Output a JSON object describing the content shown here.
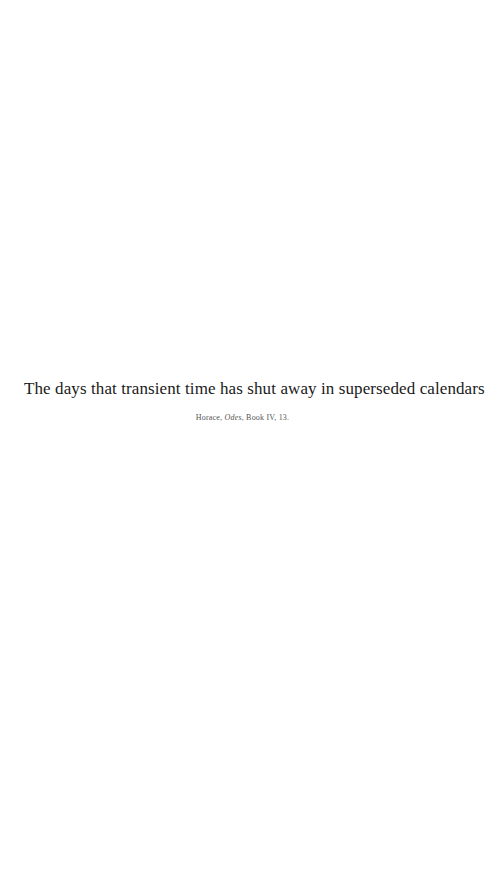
{
  "page": {
    "background_color": "#ffffff",
    "width": 485,
    "height": 876
  },
  "quote": {
    "text": "The days that transient time has shut away in superseded calendars.",
    "color": "#1a1a1a"
  },
  "attribution": {
    "author": "Horace,",
    "work": "Odes",
    "locus": ", Book IV, 13.",
    "full_text": "Horace, Odes, Book IV, 13.",
    "color": "#555555"
  }
}
